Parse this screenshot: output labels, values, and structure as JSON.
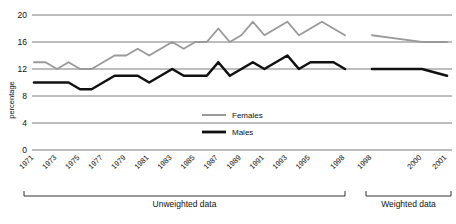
{
  "chart_data": {
    "type": "line",
    "title": "",
    "xlabel": "",
    "ylabel": "percentage",
    "ylim": [
      0,
      20
    ],
    "ytick_labels": [
      "0",
      "4",
      "8",
      "12",
      "16",
      "20"
    ],
    "yticks": [
      0,
      4,
      8,
      12,
      16,
      20
    ],
    "grid": true,
    "legend_position": "inside-center",
    "x_tick_labels_unweighted": [
      "1971",
      "1973",
      "1975",
      "1977",
      "1979",
      "1981",
      "1983",
      "1985",
      "1987",
      "1989",
      "1991",
      "1993",
      "1995",
      "1998"
    ],
    "x_tick_labels_weighted": [
      "1998",
      "2000",
      "2001"
    ],
    "x_unweighted": [
      1971,
      1972,
      1973,
      1974,
      1975,
      1976,
      1977,
      1978,
      1979,
      1980,
      1981,
      1982,
      1983,
      1984,
      1985,
      1986,
      1987,
      1988,
      1989,
      1990,
      1991,
      1992,
      1993,
      1994,
      1995,
      1996,
      1997,
      1998
    ],
    "x_weighted": [
      1998,
      1999,
      2000,
      2001
    ],
    "series": [
      {
        "name": "Females",
        "color": "#9a9a9a",
        "values_unweighted": [
          13,
          13,
          12,
          13,
          12,
          12,
          13,
          14,
          14,
          15,
          14,
          15,
          16,
          15,
          16,
          16,
          18,
          16,
          17,
          19,
          17,
          18,
          19,
          17,
          18,
          19,
          18,
          17
        ],
        "values_weighted": [
          17,
          16.5,
          16,
          16
        ]
      },
      {
        "name": "Males",
        "color": "#111111",
        "values_unweighted": [
          10,
          10,
          10,
          10,
          9,
          9,
          10,
          11,
          11,
          11,
          10,
          11,
          12,
          11,
          11,
          11,
          13,
          11,
          12,
          13,
          12,
          13,
          14,
          12,
          13,
          13,
          13,
          12
        ],
        "values_weighted": [
          12,
          12,
          12,
          11
        ]
      }
    ],
    "group_brackets": [
      {
        "label": "Unweighted data"
      },
      {
        "label": "Weighted data"
      }
    ]
  },
  "legend": {
    "entries": [
      {
        "label": "Females"
      },
      {
        "label": "Males"
      }
    ]
  },
  "axis": {
    "y_title": "percentage"
  }
}
